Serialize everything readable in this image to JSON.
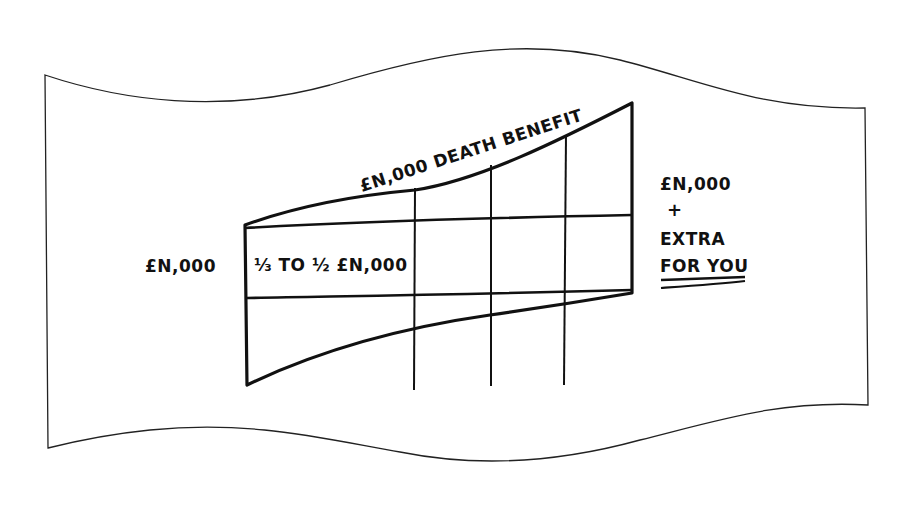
{
  "diagram": {
    "style": "hand-drawn sketch on wavy sheet of paper",
    "colors": {
      "ink": "#111111",
      "paper": "#ffffff",
      "frame": "#222222"
    },
    "labels": {
      "top_curve": "£N,000 DEATH BENEFIT",
      "left_value": "£N,000",
      "band_text": "⅓ TO ½ £N,000",
      "right_line1": "£N,000",
      "right_plus": "+",
      "right_line2": "EXTRA",
      "right_line3": "FOR YOU"
    },
    "structure": {
      "vertical_dividers": 3,
      "bands": [
        "upper growing death benefit area",
        "middle band of one third to one half",
        "lower growing area"
      ]
    }
  }
}
